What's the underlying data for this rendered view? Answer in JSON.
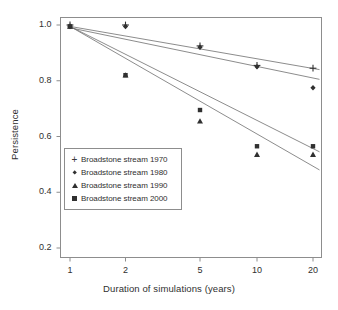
{
  "chart_data": {
    "type": "scatter",
    "title": "",
    "xlabel": "Duration of simulations (years)",
    "ylabel": "Persistence",
    "x_scale": "log",
    "x": [
      1,
      2,
      5,
      10,
      20
    ],
    "xtick_labels": [
      "1",
      "2",
      "5",
      "10",
      "20"
    ],
    "ytick_labels": [
      "1.0",
      "0.8",
      "0.6",
      "0.4",
      "0.2"
    ],
    "ytick_values": [
      1.0,
      0.8,
      0.6,
      0.4,
      0.2
    ],
    "ylim": [
      0.2,
      1.0
    ],
    "grid": false,
    "legend_position": "lower-left-inside",
    "series": [
      {
        "name": "Broadstone stream 1970",
        "marker": "plus",
        "values": [
          1.0,
          1.0,
          0.925,
          0.855,
          0.845
        ],
        "fit_start": 0.995,
        "fit_end": 0.84
      },
      {
        "name": "Broadstone stream 1980",
        "marker": "diamond",
        "values": [
          0.995,
          0.995,
          0.92,
          0.85,
          0.775
        ],
        "fit_start": 0.99,
        "fit_end": 0.805
      },
      {
        "name": "Broadstone stream 1990",
        "marker": "triangle",
        "values": [
          0.995,
          0.82,
          0.655,
          0.535,
          0.535
        ],
        "fit_start": 0.995,
        "fit_end": 0.48
      },
      {
        "name": "Broadstone stream 2000",
        "marker": "square",
        "values": [
          0.995,
          0.82,
          0.695,
          0.565,
          0.565
        ],
        "fit_start": 0.995,
        "fit_end": 0.545
      }
    ]
  },
  "legend": {
    "items": [
      {
        "label": "Broadstone stream 1970",
        "marker": "plus-marker"
      },
      {
        "label": "Broadstone stream 1980",
        "marker": "diamond-marker"
      },
      {
        "label": "Broadstone stream 1990",
        "marker": "triangle-marker"
      },
      {
        "label": "Broadstone stream 2000",
        "marker": "square-marker"
      }
    ]
  },
  "colors": {
    "axis": "#8d8d8d",
    "marker": "#303030",
    "line": "#6f6f6f",
    "text": "#2f2f2f",
    "background": "#ffffff"
  }
}
